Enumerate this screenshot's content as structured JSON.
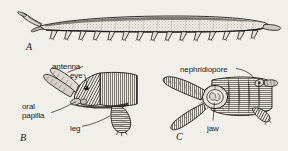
{
  "figure": {
    "background_color": "#f1efe9",
    "ink_color": "#1a1a18",
    "panels": [
      {
        "id": "A",
        "label": "A",
        "caption": "whole animal, lateral view",
        "label_x": 26,
        "label_y": 41
      },
      {
        "id": "B",
        "label": "B",
        "caption": "anterior end, lateral view",
        "label_x": 20,
        "label_y": 132
      },
      {
        "id": "C",
        "label": "C",
        "caption": "anterior end, ventral view",
        "label_x": 176,
        "label_y": 131
      }
    ],
    "annotations": [
      {
        "id": "antenna",
        "text": "antenna",
        "panel": "B",
        "x": 52,
        "y": 62
      },
      {
        "id": "eye",
        "text": "eye",
        "panel": "B",
        "x": 70,
        "y": 71
      },
      {
        "id": "oral",
        "text": "oral",
        "panel": "B",
        "x": 22,
        "y": 102
      },
      {
        "id": "papilla",
        "text": "papilla",
        "panel": "B",
        "x": 22,
        "y": 111
      },
      {
        "id": "leg",
        "text": "leg",
        "panel": "B",
        "x": 70,
        "y": 124
      },
      {
        "id": "nephridiopore",
        "text": "nephridiopore",
        "panel": "C",
        "x": 180,
        "y": 65
      },
      {
        "id": "jaw",
        "text": "jaw",
        "panel": "C",
        "x": 207,
        "y": 124
      }
    ],
    "panel_a": {
      "leg_count": 15,
      "body_texture": "stipple",
      "orientation": "head-left"
    }
  }
}
